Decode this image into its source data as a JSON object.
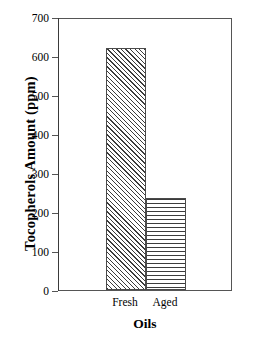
{
  "chart_data": {
    "type": "bar",
    "title": "",
    "xlabel": "Oils",
    "ylabel": "Tocopherols Amount (ppm)",
    "categories": [
      "Fresh",
      "Aged"
    ],
    "values": [
      620,
      235
    ],
    "ylim": [
      0,
      700
    ],
    "yticks": [
      0,
      100,
      200,
      300,
      400,
      500,
      600,
      700
    ],
    "ytick_labels": [
      "0",
      "100",
      "200",
      "300",
      "400",
      "500",
      "600",
      "700"
    ],
    "grid": false,
    "legend": "none",
    "series": [
      {
        "name": "Tocopherols Amount",
        "values": [
          620,
          235
        ],
        "patterns": [
          "diagonal-hatch",
          "horizontal-hatch"
        ]
      }
    ],
    "bar_patterns": [
      "diagonal-hatch",
      "horizontal-hatch"
    ],
    "colors": {
      "background": "#ffffff",
      "axis": "#555555",
      "bar_outline": "#4a4a4a",
      "hatch": "#3c3c3c",
      "text": "#000000"
    }
  }
}
